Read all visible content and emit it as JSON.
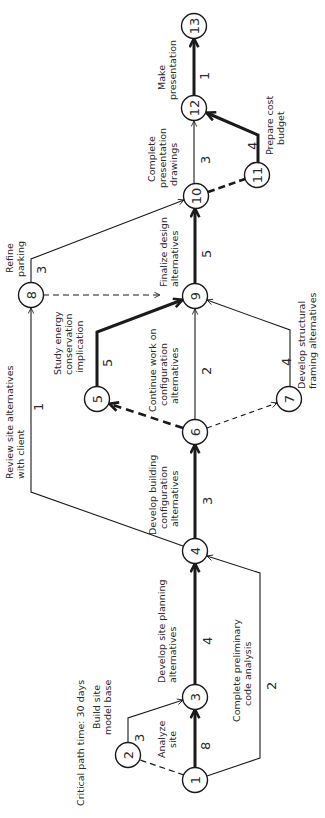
{
  "diagram": {
    "rotation_deg": -90,
    "footer": "Critical path time:  30 days",
    "nodes": [
      {
        "id": "1",
        "x": 195,
        "y": 780
      },
      {
        "id": "2",
        "x": 128,
        "y": 755
      },
      {
        "id": "3",
        "x": 195,
        "y": 697
      },
      {
        "id": "4",
        "x": 195,
        "y": 551
      },
      {
        "id": "5",
        "x": 97,
        "y": 399
      },
      {
        "id": "6",
        "x": 195,
        "y": 432
      },
      {
        "id": "7",
        "x": 289,
        "y": 399
      },
      {
        "id": "8",
        "x": 31,
        "y": 295
      },
      {
        "id": "9",
        "x": 195,
        "y": 296
      },
      {
        "id": "10",
        "x": 196,
        "y": 196
      },
      {
        "id": "11",
        "x": 257,
        "y": 175
      },
      {
        "id": "12",
        "x": 194,
        "y": 108
      },
      {
        "id": "13",
        "x": 194,
        "y": 26
      }
    ],
    "activities": [
      {
        "from": "1",
        "to": "3",
        "label": [
          "Analyze",
          "site"
        ],
        "duration": "8",
        "critical": true,
        "dummy": false
      },
      {
        "from": "1",
        "to": "2",
        "label": [],
        "duration": "",
        "critical": false,
        "dummy": true
      },
      {
        "from": "2",
        "to": "3",
        "label": [
          "Build site",
          "model base"
        ],
        "duration": "3",
        "critical": false,
        "dummy": false
      },
      {
        "from": "1",
        "to": "4",
        "label": [
          "Complete preliminary",
          "code analysis"
        ],
        "duration": "2",
        "critical": false,
        "dummy": false
      },
      {
        "from": "3",
        "to": "4",
        "label": [
          "Develop site planning",
          "alternatives"
        ],
        "duration": "4",
        "critical": true,
        "dummy": false
      },
      {
        "from": "4",
        "to": "6",
        "label": [
          "Develop building",
          "configuration",
          "alternatives"
        ],
        "duration": "3",
        "critical": true,
        "dummy": false
      },
      {
        "from": "4",
        "to": "8",
        "label": [
          "Review site alternatives",
          "with client"
        ],
        "duration": "1",
        "critical": false,
        "dummy": false
      },
      {
        "from": "6",
        "to": "5",
        "label": [],
        "duration": "",
        "critical": true,
        "dummy": true
      },
      {
        "from": "6",
        "to": "7",
        "label": [],
        "duration": "",
        "critical": false,
        "dummy": true
      },
      {
        "from": "5",
        "to": "9",
        "label": [
          "Study energy",
          "conservation",
          "implication"
        ],
        "duration": "5",
        "critical": true,
        "dummy": false
      },
      {
        "from": "6",
        "to": "9",
        "label": [
          "Continue work on",
          "configuration",
          "alternatives"
        ],
        "duration": "2",
        "critical": false,
        "dummy": false
      },
      {
        "from": "7",
        "to": "9",
        "label": [
          "Develop structural",
          "framing alternatives"
        ],
        "duration": "4",
        "critical": false,
        "dummy": false
      },
      {
        "from": "8",
        "to": "9",
        "label": [],
        "duration": "",
        "critical": false,
        "dummy": true
      },
      {
        "from": "8",
        "to": "10",
        "label": [
          "Refine",
          "parking"
        ],
        "duration": "3",
        "critical": false,
        "dummy": false
      },
      {
        "from": "9",
        "to": "10",
        "label": [
          "Finalize design",
          "alternatives"
        ],
        "duration": "5",
        "critical": true,
        "dummy": false
      },
      {
        "from": "10",
        "to": "11",
        "label": [],
        "duration": "",
        "critical": true,
        "dummy": true
      },
      {
        "from": "10",
        "to": "12",
        "label": [
          "Complete",
          "presentation",
          "drawings"
        ],
        "duration": "3",
        "critical": false,
        "dummy": false
      },
      {
        "from": "11",
        "to": "12",
        "label": [
          "Prepare cost",
          "budget"
        ],
        "duration": "4",
        "critical": true,
        "dummy": false
      },
      {
        "from": "12",
        "to": "13",
        "label": [
          "Make",
          "presentation"
        ],
        "duration": "1",
        "critical": true,
        "dummy": false
      }
    ],
    "critical_path": [
      "1",
      "3",
      "4",
      "6",
      "5",
      "9",
      "10",
      "11",
      "12",
      "13"
    ],
    "critical_path_days": 30
  }
}
